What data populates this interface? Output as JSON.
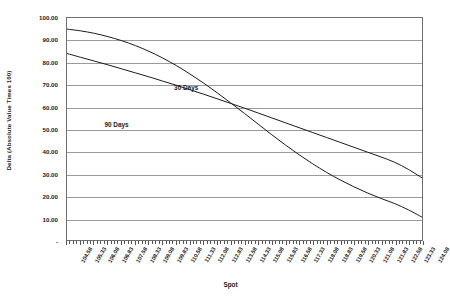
{
  "chart_data": {
    "type": "line",
    "title": "",
    "xlabel": "Spot",
    "ylabel": "Delta (Absolute Value Times 100)",
    "xlim": [
      104.58,
      124.08
    ],
    "ylim": [
      0,
      100
    ],
    "grid": true,
    "legend_position": "inline-annotation",
    "y_tick_labels": [
      "100.00",
      "90.00",
      "80.00",
      "70.00",
      "60.00",
      "50.00",
      "40.00",
      "30.00",
      "20.00",
      "10.00",
      "-"
    ],
    "y_tick_values": [
      100,
      90,
      80,
      70,
      60,
      50,
      40,
      30,
      20,
      10,
      0
    ],
    "categories": [
      "104.58",
      "105.33",
      "106.08",
      "106.83",
      "107.58",
      "108.33",
      "109.08",
      "109.83",
      "110.58",
      "111.33",
      "112.08",
      "112.83",
      "113.58",
      "114.33",
      "115.08",
      "115.83",
      "116.58",
      "117.33",
      "118.08",
      "118.83",
      "119.58",
      "120.33",
      "121.08",
      "121.83",
      "122.58",
      "123.33",
      "124.08"
    ],
    "x_values": [
      104.58,
      105.33,
      106.08,
      106.83,
      107.58,
      108.33,
      109.08,
      109.83,
      110.58,
      111.33,
      112.08,
      112.83,
      113.58,
      114.33,
      115.08,
      115.83,
      116.58,
      117.33,
      118.08,
      118.83,
      119.58,
      120.33,
      121.08,
      121.83,
      122.58,
      123.33,
      124.08
    ],
    "series": [
      {
        "name": "30 Days",
        "label_text": "30 Days",
        "color": "#1b1b1b",
        "values": [
          95.0,
          94.2,
          93.1,
          91.6,
          89.8,
          87.6,
          85.0,
          82.0,
          78.6,
          74.8,
          70.7,
          66.3,
          61.7,
          57.0,
          52.2,
          47.4,
          42.8,
          38.4,
          34.3,
          30.5,
          27.1,
          24.0,
          21.2,
          18.7,
          16.4,
          13.6,
          10.3
        ]
      },
      {
        "name": "90 Days",
        "label_text": "90 Days",
        "color": "#1b1b1b",
        "values": [
          84.0,
          82.3,
          80.6,
          78.9,
          77.1,
          75.3,
          73.5,
          71.6,
          69.7,
          67.7,
          65.7,
          63.6,
          61.5,
          59.4,
          57.2,
          55.0,
          52.8,
          50.6,
          48.4,
          46.2,
          44.0,
          41.8,
          39.6,
          37.4,
          35.0,
          31.8,
          28.0
        ]
      }
    ],
    "annotations": [
      {
        "text": "30 Days",
        "x_frac": 0.3,
        "y_frac": 0.295
      },
      {
        "text": "90 Days",
        "x_frac": 0.105,
        "y_frac": 0.46
      }
    ]
  }
}
